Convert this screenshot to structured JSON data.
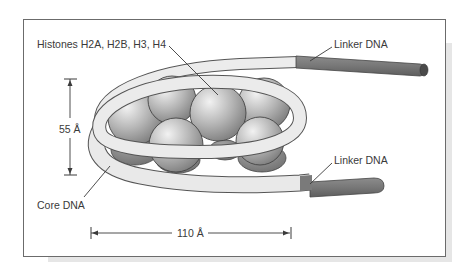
{
  "figure": {
    "labels": {
      "histones": "Histones H2A, H2B, H3, H4",
      "linker_top": "Linker DNA",
      "linker_bottom": "Linker DNA",
      "core_dna": "Core DNA",
      "height": "55 Å",
      "width": "110 Å"
    },
    "colors": {
      "frame": "#6b6b6b",
      "core_dna_fill": "#e9e9e9",
      "linker_dna_fill": "#7c7c7c",
      "histone_light": "#ececec",
      "histone_dark": "#8a8a8a",
      "text": "#3a3a3a"
    }
  }
}
